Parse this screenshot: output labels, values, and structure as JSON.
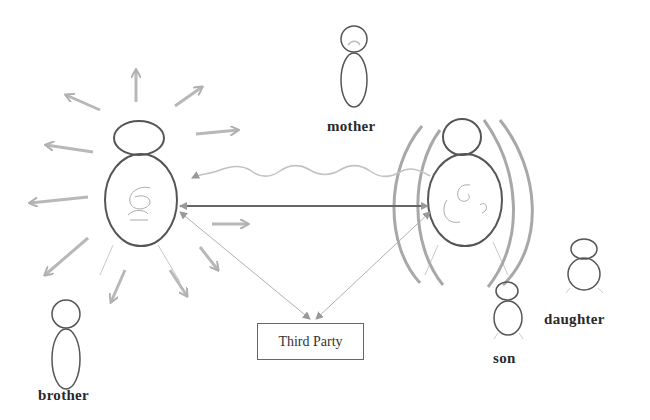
{
  "diagram": {
    "title": "",
    "nodes": {
      "mother": {
        "label": "mother"
      },
      "brother": {
        "label": "brother"
      },
      "son": {
        "label": "son"
      },
      "daughter": {
        "label": "daughter"
      },
      "third_party": {
        "label": "Third Party"
      }
    },
    "figures": [
      {
        "id": "left-person",
        "description": "large figure radiating arrows outward"
      },
      {
        "id": "right-person",
        "description": "large figure surrounded by protective arcs"
      }
    ],
    "connections": [
      {
        "from": "right-person",
        "to": "left-person",
        "style": "wavy",
        "arrow": "to"
      },
      {
        "from": "left-person",
        "to": "right-person",
        "style": "solid",
        "arrow": "both"
      },
      {
        "from": "left-person",
        "to": "third_party",
        "style": "thin",
        "arrow": "both"
      },
      {
        "from": "right-person",
        "to": "third_party",
        "style": "thin",
        "arrow": "both"
      }
    ],
    "colors": {
      "outline": "#555555",
      "arrow": "#b5b5b5",
      "arcs": "#a8a8a8",
      "text": "#2a2a2a"
    }
  }
}
